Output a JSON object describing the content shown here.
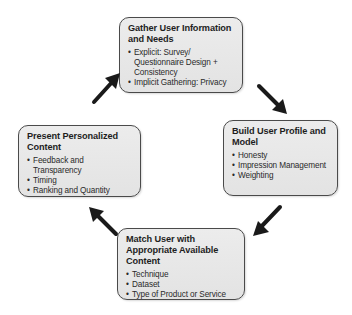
{
  "diagram": {
    "type": "cycle",
    "boxes": [
      {
        "id": "gather",
        "title": "Gather User Information and Needs",
        "items": [
          "Explicit: Survey/ Questionnaire Design + Consistency",
          "Implicit Gathering: Privacy"
        ]
      },
      {
        "id": "build",
        "title": "Build User Profile and Model",
        "items": [
          "Honesty",
          "Impression Management",
          "Weighting"
        ]
      },
      {
        "id": "match",
        "title": "Match User with Appropriate Available Content",
        "items": [
          "Technique",
          "Dataset",
          "Type of Product or Service"
        ]
      },
      {
        "id": "present",
        "title": "Present Personalized Content",
        "items": [
          "Feedback and Transparency",
          "Timing",
          "Ranking and Quantity"
        ]
      }
    ],
    "bullet": "•",
    "arrows": [
      {
        "from": "present",
        "to": "gather",
        "direction": "up-right"
      },
      {
        "from": "gather",
        "to": "build",
        "direction": "down-right"
      },
      {
        "from": "build",
        "to": "match",
        "direction": "down-left"
      },
      {
        "from": "match",
        "to": "present",
        "direction": "up-left"
      }
    ],
    "colors": {
      "box_fill": "#e8e8e8",
      "box_border": "#4a4a4a",
      "arrow": "#1a1a1a",
      "text": "#222222"
    }
  }
}
